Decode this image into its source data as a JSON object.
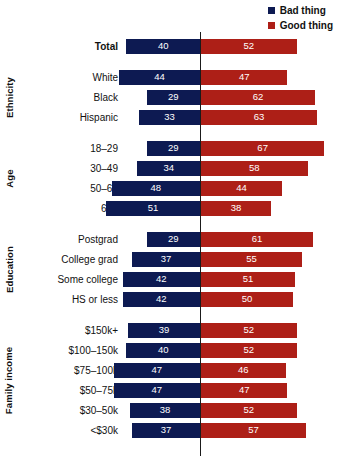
{
  "legend": {
    "items": [
      {
        "label": "Bad thing",
        "color": "#0d1a52",
        "icon": "square-swatch-icon"
      },
      {
        "label": "Good thing",
        "color": "#ad1f17",
        "icon": "square-swatch-icon"
      }
    ]
  },
  "colors": {
    "bad": "#0d1a52",
    "good": "#ad1f17",
    "axis_line": "#1a1a1a",
    "text": "#111111",
    "background": "#ffffff",
    "value_text": "#ffffff"
  },
  "axis": {
    "center_value": 0,
    "px_per_unit": 1.84,
    "center_x_px": 200
  },
  "groups": [
    {
      "name": "",
      "label": "",
      "rows": [
        {
          "label": "Total",
          "bad": 40,
          "good": 52,
          "bold": true
        }
      ]
    },
    {
      "name": "ethnicity",
      "label": "Ethnicity",
      "rows": [
        {
          "label": "White",
          "bad": 44,
          "good": 47,
          "bold": false
        },
        {
          "label": "Black",
          "bad": 29,
          "good": 62,
          "bold": false
        },
        {
          "label": "Hispanic",
          "bad": 33,
          "good": 63,
          "bold": false
        }
      ]
    },
    {
      "name": "age",
      "label": "Age",
      "rows": [
        {
          "label": "18–29",
          "bad": 29,
          "good": 67,
          "bold": false
        },
        {
          "label": "30–49",
          "bad": 34,
          "good": 58,
          "bold": false
        },
        {
          "label": "50–64",
          "bad": 48,
          "good": 44,
          "bold": false
        },
        {
          "label": "65+",
          "bad": 51,
          "good": 38,
          "bold": false
        }
      ]
    },
    {
      "name": "education",
      "label": "Education",
      "rows": [
        {
          "label": "Postgrad",
          "bad": 29,
          "good": 61,
          "bold": false
        },
        {
          "label": "College grad",
          "bad": 37,
          "good": 55,
          "bold": false
        },
        {
          "label": "Some college",
          "bad": 42,
          "good": 51,
          "bold": false
        },
        {
          "label": "HS or less",
          "bad": 42,
          "good": 50,
          "bold": false
        }
      ]
    },
    {
      "name": "family-income",
      "label": "Family income",
      "rows": [
        {
          "label": "$150k+",
          "bad": 39,
          "good": 52,
          "bold": false
        },
        {
          "label": "$100–150k",
          "bad": 40,
          "good": 52,
          "bold": false
        },
        {
          "label": "$75–100k",
          "bad": 47,
          "good": 46,
          "bold": false
        },
        {
          "label": "$50–75k",
          "bad": 47,
          "good": 47,
          "bold": false
        },
        {
          "label": "$30–50k",
          "bad": 38,
          "good": 52,
          "bold": false
        },
        {
          "label": "<$30k",
          "bad": 37,
          "good": 57,
          "bold": false
        }
      ]
    }
  ],
  "chart_data": {
    "type": "bar",
    "subtype": "diverging-horizontal",
    "title": "",
    "xlabel": "",
    "ylabel": "",
    "legend_position": "top-right",
    "grid": false,
    "categories": [
      "Total",
      "White",
      "Black",
      "Hispanic",
      "18–29",
      "30–49",
      "50–64",
      "65+",
      "Postgrad",
      "College grad",
      "Some college",
      "HS or less",
      "$150k+",
      "$100–150k",
      "$75–100k",
      "$50–75k",
      "$30–50k",
      "<$30k"
    ],
    "category_groups": [
      "",
      "Ethnicity",
      "Ethnicity",
      "Ethnicity",
      "Age",
      "Age",
      "Age",
      "Age",
      "Education",
      "Education",
      "Education",
      "Education",
      "Family income",
      "Family income",
      "Family income",
      "Family income",
      "Family income",
      "Family income"
    ],
    "series": [
      {
        "name": "Bad thing",
        "color": "#0d1a52",
        "direction": "left",
        "values": [
          40,
          44,
          29,
          33,
          29,
          34,
          48,
          51,
          29,
          37,
          42,
          42,
          39,
          40,
          47,
          47,
          38,
          37
        ]
      },
      {
        "name": "Good thing",
        "color": "#ad1f17",
        "direction": "right",
        "values": [
          52,
          47,
          62,
          63,
          67,
          58,
          44,
          38,
          61,
          55,
          51,
          50,
          52,
          52,
          46,
          47,
          52,
          57
        ]
      }
    ],
    "xlim": [
      -60,
      70
    ],
    "units": "percent"
  }
}
